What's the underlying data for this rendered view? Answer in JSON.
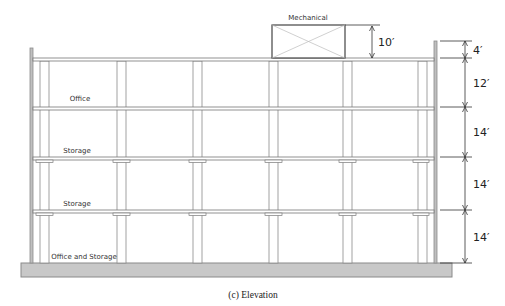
{
  "figure": {
    "caption": "(c) Elevation",
    "rooftop": {
      "label": "Mechanical",
      "height_label": "10′"
    },
    "floors": [
      {
        "label": "Office and Storage",
        "height_label": "14′"
      },
      {
        "label": "Storage",
        "height_label": "14′"
      },
      {
        "label": "Storage",
        "height_label": "14′"
      },
      {
        "label": "Office",
        "height_label": "12′"
      }
    ],
    "parapet": {
      "height_label": "4′"
    },
    "column_count": 6,
    "colors": {
      "line": "#7a7a7a",
      "wall": "#8c8c8c",
      "foundation_fill": "#c8c8c8",
      "foundation_stroke": "#8a8a8a",
      "dim_line": "#333333"
    }
  }
}
